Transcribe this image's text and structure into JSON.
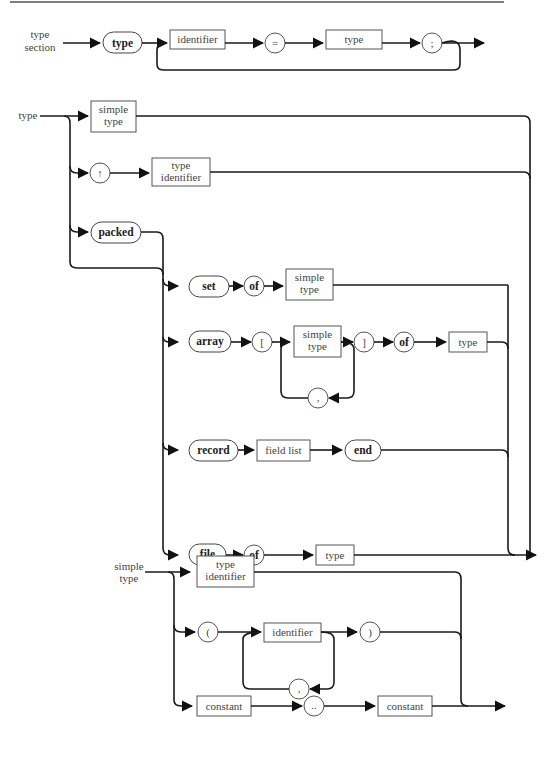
{
  "page": {
    "header_rule_color": "#555555"
  },
  "type_section": {
    "label_line1": "type",
    "label_line2": "section",
    "keyword": "type",
    "identifier": "identifier",
    "equals": "=",
    "type": "type",
    "semicolon": ";"
  },
  "type": {
    "label": "type",
    "simple_type_l1": "simple",
    "simple_type_l2": "type",
    "pointer": "↑",
    "type_identifier_l1": "type",
    "type_identifier_l2": "identifier",
    "packed": "packed",
    "set": "set",
    "set_of": "of",
    "set_simple_l1": "simple",
    "set_simple_l2": "type",
    "array": "array",
    "lbracket": "[",
    "array_simple_l1": "simple",
    "array_simple_l2": "type",
    "comma": ",",
    "rbracket": "]",
    "array_of": "of",
    "array_type": "type",
    "record": "record",
    "field_list": "field list",
    "end": "end",
    "file": "file",
    "file_of": "of",
    "file_type": "type"
  },
  "simple_type": {
    "label_line1": "simple",
    "label_line2": "type",
    "type_identifier_l1": "type",
    "type_identifier_l2": "identifier",
    "lparen": "(",
    "identifier": "identifier",
    "comma": ",",
    "rparen": ")",
    "constant1": "constant",
    "range": "..",
    "constant2": "constant"
  }
}
